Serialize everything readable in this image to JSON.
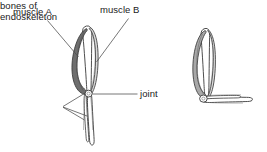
{
  "figure": {
    "title": "",
    "type": "biology-diagram",
    "background_color": "#ffffff",
    "line_color": "#3a3a3a",
    "muscle_a_fill": "#6e6e6e",
    "muscle_b_fill": "#d9d9d9",
    "bone_fill": "#ffffff",
    "text_color": "#1a1a1a"
  },
  "labels": {
    "muscle_a": "muscle A",
    "muscle_b": "muscle B",
    "joint": "joint",
    "bones_line1": "bones of",
    "bones_line2": "endoskeleton"
  },
  "panels": [
    {
      "name": "extended-limb",
      "state": "relaxed / extended",
      "position": "left"
    },
    {
      "name": "flexed-limb",
      "state": "contracted / flexed",
      "position": "right"
    }
  ]
}
